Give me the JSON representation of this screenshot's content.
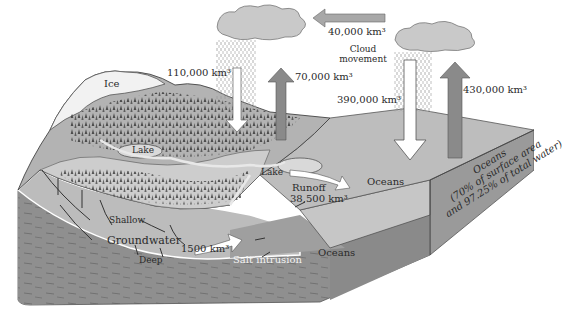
{
  "diagram": {
    "colors": {
      "background": "#ffffff",
      "ocean_surface": "#bdbdbd",
      "ocean_side": "#c8c8c8",
      "land_light": "#cfcfcf",
      "land_mid": "#a9a9a9",
      "forest": "#4a4a4a",
      "ice": "#f2f2f2",
      "bedrock": "#8e8e8e",
      "groundwater": "#b8b8b8",
      "cloud": "#c9c9c9",
      "evap_arrow": "#8a8a8a",
      "precip_arrow": "#ffffff",
      "text": "#2a2a2a"
    },
    "labels": {
      "ice": "Ice",
      "lake_1": "Lake",
      "lake_2": "Lake",
      "land_precipitation": "110,000 km³",
      "land_evaporation": "70,000 km³",
      "cloud_transport": "40,000 km³",
      "cloud_movement_line1": "Cloud",
      "cloud_movement_line2": "movement",
      "ocean_precipitation": "390,000 km³",
      "ocean_evaporation": "430,000 km³",
      "runoff_line1": "Runoff",
      "runoff_line2": "38,500 km³",
      "oceans_surface": "Oceans",
      "oceans_side_line1": "Oceans",
      "oceans_side_line2": "(70% of surface area",
      "oceans_side_line3": "and 97.25% of total water)",
      "shallow": "Shallow",
      "groundwater": "Groundwater",
      "deep": "Deep",
      "groundwater_discharge": "1500 km³",
      "salt_intrusion": "Salt intrusion",
      "oceans_subsurface": "Oceans"
    },
    "flows": [
      {
        "name": "Precipitation over land",
        "value_km3": 110000,
        "direction": "down"
      },
      {
        "name": "Evaporation from land",
        "value_km3": 70000,
        "direction": "up"
      },
      {
        "name": "Cloud movement ocean to land",
        "value_km3": 40000,
        "direction": "left"
      },
      {
        "name": "Precipitation over ocean",
        "value_km3": 390000,
        "direction": "down"
      },
      {
        "name": "Evaporation from ocean",
        "value_km3": 430000,
        "direction": "up"
      },
      {
        "name": "Surface runoff",
        "value_km3": 38500,
        "direction": "to ocean"
      },
      {
        "name": "Groundwater discharge",
        "value_km3": 1500,
        "direction": "to ocean"
      }
    ]
  }
}
